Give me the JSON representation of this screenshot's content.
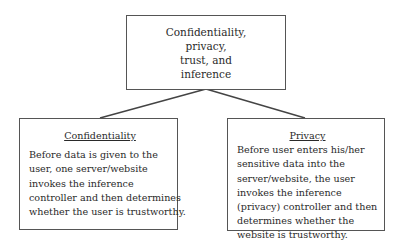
{
  "diagram": {
    "root": {
      "lines": [
        "Confidentiality,",
        "privacy,",
        "trust, and",
        "inference"
      ]
    },
    "children": [
      {
        "title": "Confidentiality",
        "lines": [
          "Before data is given to the",
          "user, one server/website",
          "invokes the inference",
          "controller and then determines",
          "whether the user is trustworthy."
        ]
      },
      {
        "title": "Privacy",
        "lines": [
          "Before user enters his/her",
          "sensitive data into the",
          "server/website, the user",
          "invokes the inference",
          "(privacy) controller and then",
          "determines whether the",
          "website is trustworthy."
        ]
      }
    ],
    "colors": {
      "border": "#555555",
      "text": "#2a2a2a",
      "background": "#ffffff"
    }
  }
}
